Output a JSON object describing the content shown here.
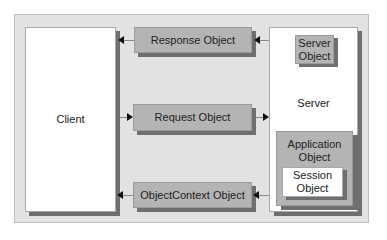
{
  "diagram": {
    "client": {
      "label": "Client"
    },
    "server": {
      "label": "Server"
    },
    "connectors": [
      {
        "label": "Response Object",
        "direction": "to-client"
      },
      {
        "label": "Request Object",
        "direction": "to-server"
      },
      {
        "label": "ObjectContext Object",
        "direction": "to-client"
      }
    ],
    "server_objects": {
      "server_object": {
        "line1": "Server",
        "line2": "Object"
      },
      "application_object": {
        "line1": "Application",
        "line2": "Object"
      },
      "session_object": {
        "line1": "Session",
        "line2": "Object"
      }
    },
    "colors": {
      "background": "#e2e2e2",
      "object_fill": "#b4b4b4",
      "shadow": "#6f6f6f",
      "box": "#ffffff"
    }
  }
}
